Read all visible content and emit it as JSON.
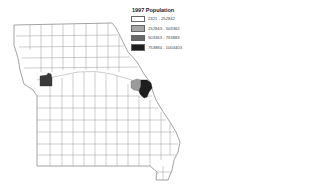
{
  "legend": {
    "title": "1997 Population",
    "items": [
      {
        "label": "2321 - 252842",
        "color": "#ffffff"
      },
      {
        "label": "252843 - 503362",
        "color": "#a6a6a6"
      },
      {
        "label": "503363 - 753883",
        "color": "#6a6a6a"
      },
      {
        "label": "753884 - 1004403",
        "color": "#1e1e1e"
      }
    ]
  },
  "map": {
    "region": "Missouri counties",
    "highlighted_counties": [
      {
        "name": "Jackson",
        "class": "753884 - 1004403",
        "color": "#3a3a3a"
      },
      {
        "name": "St. Charles",
        "class": "252843 - 503362",
        "color": "#9a9a9a"
      },
      {
        "name": "St. Louis",
        "class": "753884 - 1004403",
        "color": "#1e1e1e"
      }
    ],
    "border_color": "#8a8a8a"
  }
}
